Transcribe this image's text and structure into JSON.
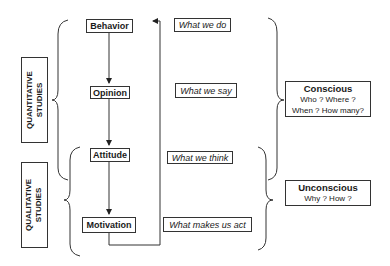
{
  "levels": [
    {
      "label": "Behavior",
      "description": "What we do"
    },
    {
      "label": "Opinion",
      "description": "What we say"
    },
    {
      "label": "Attitude",
      "description": "What we think"
    },
    {
      "label": "Motivation",
      "description": "What makes us act"
    }
  ],
  "studies": {
    "quantitative": {
      "line1": "QUANTITATIVE",
      "line2": "STUDIES"
    },
    "qualitative": {
      "line1": "QUALITATIVE",
      "line2": "STUDIES"
    }
  },
  "awareness": {
    "conscious": {
      "title": "Conscious",
      "line1": "Who ? Where ?",
      "line2": "When ? How many?"
    },
    "unconscious": {
      "title": "Unconscious",
      "line1": "Why ? How ?"
    }
  }
}
